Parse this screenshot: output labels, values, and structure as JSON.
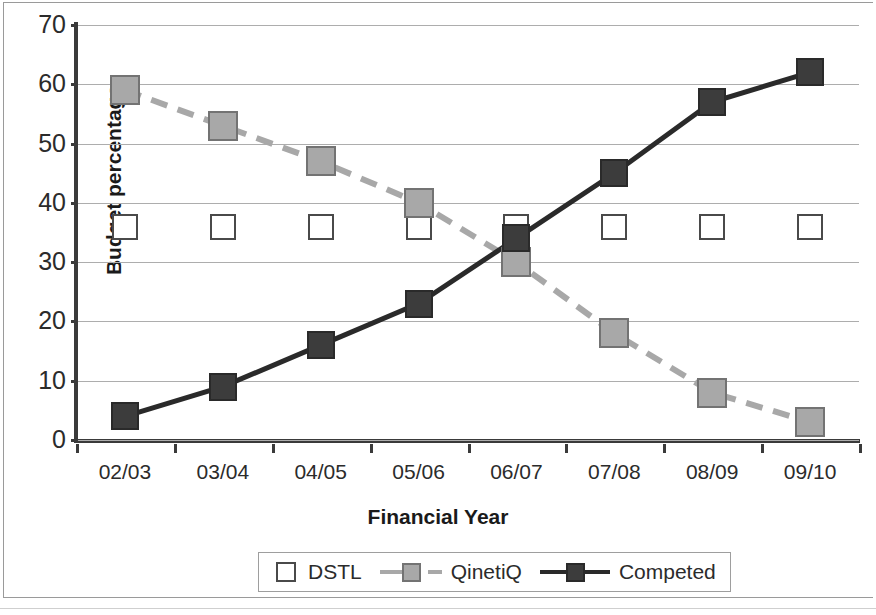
{
  "chart_data": {
    "type": "line",
    "title": "",
    "xlabel": "Financial Year",
    "ylabel": "Budget percentage",
    "categories": [
      "02/03",
      "03/04",
      "04/05",
      "05/06",
      "06/07",
      "07/08",
      "08/09",
      "09/10"
    ],
    "ylim": [
      0,
      70
    ],
    "ytick_step": 10,
    "yticks": [
      "0",
      "10",
      "20",
      "30",
      "40",
      "50",
      "60",
      "70"
    ],
    "grid": "horizontal",
    "legend_position": "bottom",
    "series": [
      {
        "name": "DSTL",
        "values": [
          36,
          36,
          36,
          36,
          36,
          36,
          36,
          36
        ],
        "marker": "square-hollow",
        "marker_fill": "#ffffff",
        "marker_edge": "#4a4a4a",
        "line_style": "none"
      },
      {
        "name": "QinetiQ",
        "values": [
          59,
          53,
          47,
          40,
          30,
          18,
          8,
          3
        ],
        "marker": "square-filled",
        "marker_fill": "#a8a8a8",
        "marker_edge": "#737373",
        "line_style": "dashed",
        "line_color": "#a8a8a8"
      },
      {
        "name": "Competed",
        "values": [
          4,
          9,
          16,
          23,
          34,
          45,
          57,
          62
        ],
        "marker": "square-filled",
        "marker_fill": "#3c3c3c",
        "marker_edge": "#2a2a2a",
        "line_style": "solid",
        "line_color": "#2a2a2a"
      }
    ],
    "colors": {
      "axis": "#3a3a3a",
      "gridline": "#adadad",
      "text": "#2b2b2b",
      "background": "#ffffff"
    }
  }
}
